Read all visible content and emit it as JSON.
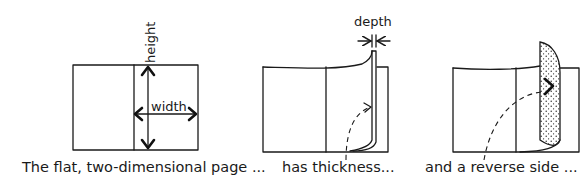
{
  "panels": [
    {
      "id": "flat-page",
      "labels": {
        "height": "height",
        "width": "width"
      },
      "caption": "The flat, two-dimensional page ..."
    },
    {
      "id": "thickness",
      "labels": {
        "depth": "depth"
      },
      "caption": "has thickness..."
    },
    {
      "id": "reverse-side",
      "caption": "and a reverse side ..."
    }
  ],
  "colors": {
    "ink": "#1a1a1a",
    "paper": "#ffffff"
  }
}
